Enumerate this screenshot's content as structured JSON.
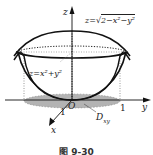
{
  "figure": {
    "caption": "图 9-30",
    "surfaces": {
      "upper": {
        "label": "z=√(2−x²−y²)",
        "display_lhs": "z=",
        "display_rad": "2−x²−y²",
        "kind": "hemisphere"
      },
      "lower": {
        "label": "z=x²+y²",
        "display": "z=x²+y²",
        "kind": "paraboloid"
      }
    },
    "axes": {
      "z": {
        "label": "z"
      },
      "y": {
        "label": "y",
        "tick": "1"
      },
      "x": {
        "label": "x",
        "tick": "1"
      },
      "origin": "O"
    },
    "region": {
      "label": "D",
      "subscript": "xy",
      "fill": "#b0b0b0"
    },
    "colors": {
      "stroke": "#111111",
      "dotted": "#444444",
      "region": "#b0b0b0"
    }
  }
}
